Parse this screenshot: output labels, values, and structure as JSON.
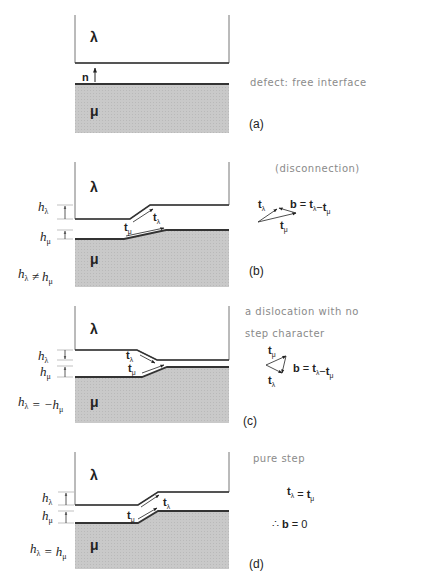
{
  "colors": {
    "line": "#333333",
    "fill_mu": "#c8c8c8",
    "frame": "#777777",
    "dim": "#999999",
    "hand": "#8a8a8a",
    "text": "#222222"
  },
  "symbols": {
    "lambda": "λ",
    "mu": "μ",
    "n": "n",
    "t": "t",
    "b": "b",
    "h": "h",
    "therefore": "∴"
  },
  "panels": [
    {
      "id": "a",
      "label": "(a)",
      "label_pos": [
        249,
        128
      ],
      "lambda_top": 15,
      "lambda_edge": [
        [
          75,
          63
        ],
        [
          229,
          63
        ]
      ],
      "mu_edge": [
        [
          75,
          84
        ],
        [
          229,
          84
        ]
      ],
      "mu_bottom": 133,
      "lambda_label_pos": [
        90,
        42
      ],
      "mu_label_pos": [
        90,
        116
      ],
      "normal": {
        "label": "n",
        "x": 95,
        "y1": 82,
        "y2": 68,
        "label_pos": [
          82,
          81
        ]
      },
      "handwritten": [
        {
          "text": "defect: free  interface",
          "pos": [
            250,
            86
          ]
        }
      ],
      "left_labels": [],
      "dims": [],
      "tvectors": [],
      "side": []
    },
    {
      "id": "b",
      "label": "(b)",
      "label_pos": [
        249,
        275
      ],
      "lambda_top": 162,
      "lambda_edge": [
        [
          75,
          219
        ],
        [
          130,
          219
        ],
        [
          150,
          205
        ],
        [
          229,
          205
        ]
      ],
      "mu_edge": [
        [
          75,
          239
        ],
        [
          124,
          239
        ],
        [
          166,
          230
        ],
        [
          229,
          230
        ]
      ],
      "mu_bottom": 287,
      "lambda_label_pos": [
        90,
        192
      ],
      "mu_label_pos": [
        90,
        264
      ],
      "left_labels": [
        {
          "text": "hλ",
          "base": "h",
          "sub": "λ",
          "pos": [
            38,
            211
          ]
        },
        {
          "text": "hμ",
          "base": "h",
          "sub": "μ",
          "pos": [
            40,
            241
          ]
        },
        {
          "text": "hλ ≠ hμ",
          "pos": [
            18,
            278
          ],
          "parts": [
            "h",
            "λ",
            " ≠ ",
            "h",
            "μ"
          ]
        }
      ],
      "dims": [
        {
          "x": 65,
          "y1": 205,
          "y2": 219,
          "dir": "up"
        },
        {
          "x": 65,
          "y1": 230,
          "y2": 239,
          "dir": "up"
        }
      ],
      "tvectors": [
        {
          "name": "t_lambda",
          "from": [
            133,
            222
          ],
          "to": [
            153,
            209
          ],
          "label": "tλ",
          "label_pos": [
            153,
            221
          ]
        },
        {
          "name": "t_mu",
          "from": [
            126,
            236
          ],
          "to": [
            164,
            228
          ],
          "label": "tμ",
          "label_pos": [
            124,
            231
          ]
        }
      ],
      "handwritten": [
        {
          "text": "(disconnection)",
          "pos": [
            275,
            172
          ]
        }
      ],
      "side": {
        "type": "triangle",
        "vectors": [
          {
            "from": [
              258,
              222
            ],
            "to": [
              277,
              209
            ],
            "label": "tλ",
            "label_pos": [
              258,
              208
            ]
          },
          {
            "from": [
              258,
              222
            ],
            "to": [
              296,
              213
            ],
            "label": "tμ",
            "label_pos": [
              280,
              229
            ]
          },
          {
            "from": [
              296,
              213
            ],
            "to": [
              279,
              208
            ],
            "label": ""
          }
        ],
        "equation": "b = tλ−tμ",
        "equation_parts": [
          "b",
          " = ",
          "t",
          "λ",
          "−",
          "t",
          "μ"
        ],
        "equation_pos": [
          290,
          208
        ]
      }
    },
    {
      "id": "c",
      "label": "(c)",
      "label_pos": [
        243,
        425
      ],
      "lambda_top": 306,
      "lambda_edge": [
        [
          75,
          350
        ],
        [
          137,
          350
        ],
        [
          157,
          360
        ],
        [
          229,
          360
        ]
      ],
      "mu_edge": [
        [
          75,
          377
        ],
        [
          142,
          377
        ],
        [
          167,
          367
        ],
        [
          229,
          367
        ]
      ],
      "mu_bottom": 423,
      "lambda_label_pos": [
        90,
        334
      ],
      "mu_label_pos": [
        90,
        407
      ],
      "left_labels": [
        {
          "text": "hλ",
          "base": "h",
          "sub": "λ",
          "pos": [
            38,
            360
          ]
        },
        {
          "text": "hμ",
          "base": "h",
          "sub": "μ",
          "pos": [
            40,
            376
          ]
        },
        {
          "text": "hλ = −hμ",
          "pos": [
            18,
            406
          ],
          "parts": [
            "h",
            "λ",
            " = −",
            "h",
            "μ"
          ]
        }
      ],
      "dims": [
        {
          "x": 65,
          "y1": 350,
          "y2": 360,
          "dir": "down"
        },
        {
          "x": 65,
          "y1": 366,
          "y2": 377,
          "dir": "up"
        }
      ],
      "tvectors": [
        {
          "name": "t_lambda",
          "from": [
            140,
            355
          ],
          "to": [
            155,
            363
          ],
          "label": "tλ",
          "label_pos": [
            126,
            359
          ]
        },
        {
          "name": "t_mu",
          "from": [
            142,
            373
          ],
          "to": [
            164,
            365
          ],
          "label": "tμ",
          "label_pos": [
            128,
            372
          ]
        }
      ],
      "handwritten": [
        {
          "text": "a  dislocation  with  no",
          "pos": [
            245,
            315
          ]
        },
        {
          "text": "step  character",
          "pos": [
            245,
            337
          ]
        }
      ],
      "side": {
        "type": "triangle",
        "vectors": [
          {
            "from": [
              266,
              365
            ],
            "to": [
              286,
              356
            ],
            "label": "tμ",
            "label_pos": [
              268,
              354
            ]
          },
          {
            "from": [
              266,
              365
            ],
            "to": [
              282,
              373
            ],
            "label": "tλ",
            "label_pos": [
              268,
              384
            ]
          },
          {
            "from": [
              286,
              356
            ],
            "to": [
              282,
              373
            ],
            "label": ""
          }
        ],
        "equation": "b = tλ−tμ",
        "equation_parts": [
          "b",
          " = ",
          "t",
          "λ",
          "−",
          "t",
          "μ"
        ],
        "equation_pos": [
          293,
          372
        ]
      }
    },
    {
      "id": "d",
      "label": "(d)",
      "label_pos": [
        249,
        568
      ],
      "lambda_top": 452,
      "lambda_edge": [
        [
          75,
          505
        ],
        [
          138,
          505
        ],
        [
          158,
          492
        ],
        [
          229,
          492
        ]
      ],
      "mu_edge": [
        [
          75,
          523
        ],
        [
          138,
          523
        ],
        [
          158,
          511
        ],
        [
          229,
          511
        ]
      ],
      "mu_bottom": 569,
      "lambda_label_pos": [
        90,
        480
      ],
      "mu_label_pos": [
        90,
        550
      ],
      "left_labels": [
        {
          "text": "hλ",
          "base": "h",
          "sub": "λ",
          "pos": [
            42,
            502
          ]
        },
        {
          "text": "hμ",
          "base": "h",
          "sub": "μ",
          "pos": [
            42,
            520
          ]
        },
        {
          "text": "hλ = hμ",
          "pos": [
            30,
            553
          ],
          "parts": [
            "h",
            "λ",
            " = ",
            "h",
            "μ"
          ]
        }
      ],
      "dims": [
        {
          "x": 66,
          "y1": 492,
          "y2": 505,
          "dir": "up"
        },
        {
          "x": 66,
          "y1": 511,
          "y2": 523,
          "dir": "up"
        }
      ],
      "tvectors": [
        {
          "name": "t_lambda",
          "from": [
            141,
            507
          ],
          "to": [
            159,
            495
          ],
          "label": "tλ",
          "label_pos": [
            163,
            506
          ]
        },
        {
          "name": "t_mu",
          "from": [
            138,
            519
          ],
          "to": [
            157,
            508
          ],
          "label": "tμ",
          "label_pos": [
            127,
            519
          ]
        }
      ],
      "handwritten": [
        {
          "text": "pure  step",
          "pos": [
            253,
            462
          ]
        }
      ],
      "side": {
        "type": "text",
        "lines": [
          {
            "parts": [
              "t",
              "λ",
              " = ",
              "t",
              "μ"
            ],
            "text": "tλ = tμ",
            "pos": [
              287,
              495
            ]
          },
          {
            "parts": [
              "∴ ",
              "b",
              " = 0"
            ],
            "text": "∴ b = 0",
            "pos": [
              272,
              528
            ]
          }
        ]
      }
    }
  ]
}
